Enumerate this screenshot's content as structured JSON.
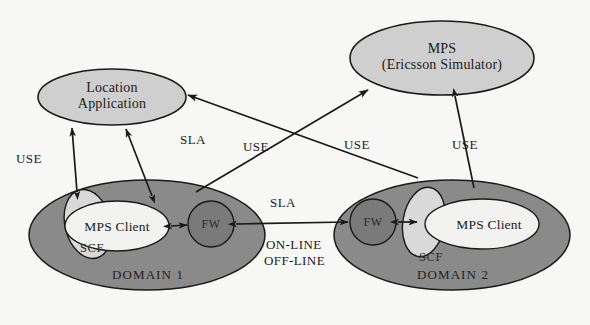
{
  "figure": {
    "background_color": "#f7f7f5"
  },
  "colors": {
    "light_ellipse_fill": "#cfcfcf",
    "domain_fill": "#8a8a8a",
    "white_fill": "#f2f2f0",
    "scf_fill": "#d9d9d9",
    "fw_fill": "#7a7a7a",
    "stroke": "#1a1a1a"
  },
  "nodes": {
    "location_application": {
      "line1": "Location",
      "line2": "Application"
    },
    "mps": {
      "line1": "MPS",
      "line2": "(Ericsson Simulator)"
    },
    "domain1": {
      "label": "DOMAIN 1",
      "mps_client": "MPS Client",
      "scf": "SCF",
      "fw": "FW"
    },
    "domain2": {
      "label": "DOMAIN 2",
      "mps_client": "MPS Client",
      "scf": "SCF",
      "fw": "FW"
    }
  },
  "edge_labels": {
    "use_left": "USE",
    "sla_left": "SLA",
    "use_center": "USE",
    "use_right_inner": "USE",
    "use_right_outer": "USE",
    "sla_center": "SLA",
    "online": "ON-LINE",
    "offline": "OFF-LINE"
  }
}
